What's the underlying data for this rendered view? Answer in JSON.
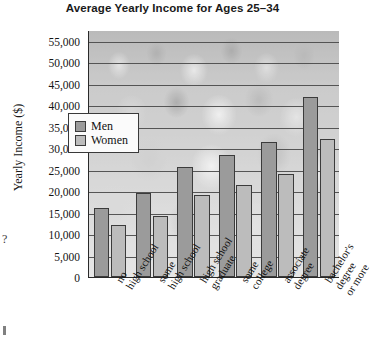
{
  "chart_data": {
    "type": "bar",
    "title": "Average Yearly Income for Ages 25–34",
    "xlabel": "",
    "ylabel": "Yearly Income ($)",
    "ylim": [
      0,
      57500
    ],
    "grid": true,
    "legend_position": "upper-left-inside",
    "categories": [
      "no high school",
      "some high school",
      "high school graduate",
      "some college",
      "associate degree",
      "bachelor's degree or more"
    ],
    "category_lines": [
      [
        "no",
        "high school"
      ],
      [
        "some",
        "high school"
      ],
      [
        "high school",
        "graduate"
      ],
      [
        "some",
        "college"
      ],
      [
        "associate",
        "degree"
      ],
      [
        "bachelor's",
        "degree",
        "or more"
      ]
    ],
    "series": [
      {
        "name": "Men",
        "color": "#9b9b9b",
        "values": [
          16000,
          19500,
          25600,
          28300,
          31500,
          42000
        ]
      },
      {
        "name": "Women",
        "color": "#bcbcbc",
        "values": [
          12000,
          14300,
          19200,
          21500,
          23900,
          32200
        ]
      }
    ],
    "y_ticks": [
      0,
      5000,
      10000,
      15000,
      20000,
      25000,
      30000,
      35000,
      40000,
      45000,
      50000,
      55000
    ],
    "y_tick_labels": [
      "0",
      "5,000",
      "10,000",
      "15,000",
      "20,000",
      "25,000",
      "30,000",
      "35,000",
      "40,000",
      "45,000",
      "50,000",
      "55,000"
    ]
  },
  "legend": {
    "items": [
      {
        "label": "Men",
        "swatch": "men"
      },
      {
        "label": "Women",
        "swatch": "women"
      }
    ]
  },
  "page_artifacts": {
    "question_mark": "?"
  }
}
